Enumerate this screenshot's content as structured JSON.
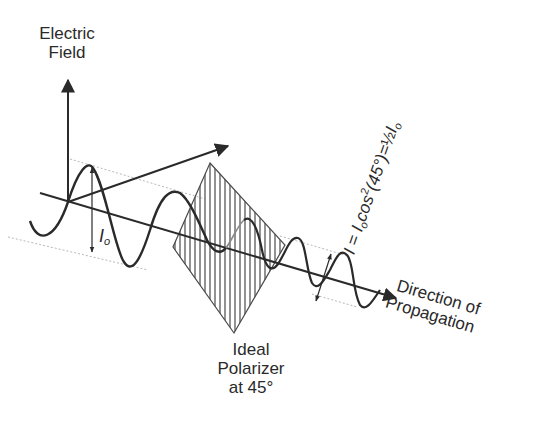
{
  "diagram": {
    "type": "physics-illustration",
    "colors": {
      "line": "#2a2a2a",
      "guide": "#b8b8b8",
      "hatch": "#4a4a4a",
      "background": "#ffffff"
    },
    "labels": {
      "electric_field_line1": "Electric",
      "electric_field_line2": "Field",
      "intensity_initial_symbol": "I",
      "intensity_initial_sub": "o",
      "polarizer_line1": "Ideal",
      "polarizer_line2": "Polarizer",
      "polarizer_line3": "at 45°",
      "direction_line1": "Direction of",
      "direction_line2": "Propagation",
      "formula_I": "I",
      "formula_eq": " = ",
      "formula_Io": "I",
      "formula_Io_sub": "o",
      "formula_cos": "cos",
      "formula_sup": "2",
      "formula_arg": "(45°)=",
      "formula_half": "½",
      "formula_Io2": "I",
      "formula_Io2_sub": "o"
    },
    "elements": {
      "axes": [
        "electric-field-axis (vertical)",
        "second transverse axis (diagonal)",
        "propagation axis"
      ],
      "waves": [
        "incident wave amplitude Io",
        "transmitted wave amplitude reduced"
      ],
      "polarizer": "hatched parallelogram, ideal polarizer at 45°"
    }
  }
}
